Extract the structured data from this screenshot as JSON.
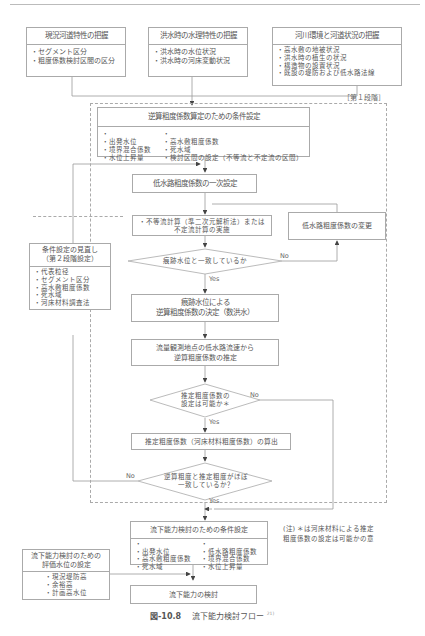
{
  "top_boxes": [
    {
      "title": "現況河道特性の把握",
      "items": [
        "セグメント区分",
        "粗度係数検討区間の区分"
      ]
    },
    {
      "title": "洪水時の水理特性の把握",
      "items": [
        "洪水時の水位状況",
        "洪水時の河床変動状況"
      ]
    },
    {
      "title": "河川環境と河道状況の把握",
      "items": [
        "高水敷の地被状況",
        "洪水時の植生の状況",
        "構造物の設置状況",
        "既設の堤防および低水路法線"
      ]
    }
  ],
  "stage1_label": "［第１段階］",
  "cond_reverse": {
    "title": "逆算粗度係数算定のための条件設定",
    "col1": [
      "出発水位",
      "境界混合係数",
      "水位上昇量"
    ],
    "col2": [
      "高水敷粗度係数",
      "死水域",
      "検討区間の設定（不等流と不定流の区間）"
    ]
  },
  "low_channel_initial": "低水路粗度係数の一次設定",
  "calc_box": {
    "line1": "・不等流計算（準二次元解析法）または",
    "line2": "不定流計算の実施"
  },
  "low_channel_change": "低水路粗度係数の変更",
  "decision1": {
    "text": "痕跡水位と一致しているか",
    "no": "No",
    "yes": "Yes"
  },
  "determine_box": {
    "line1": "痕跡水位による",
    "line2": "逆算粗度係数の決定（数洪水）"
  },
  "estimate_box": {
    "line1": "流量観測地点の低水路流速から",
    "line2": "逆算粗度係数の推定"
  },
  "decision2": {
    "line1": "推定粗度係数の",
    "line2": "設定は可能か＊",
    "no": "No",
    "yes": "Yes"
  },
  "calc_estimated": "推定粗度係数（河床材料粗度係数）の算出",
  "decision3": {
    "line1": "逆算粗度と推定粗度がほぼ",
    "line2": "一致しているか？",
    "no": "No",
    "yes": "Yes"
  },
  "review_box": {
    "title_line1": "条件設定の見直し",
    "title_line2": "（第２段階設定）",
    "items": [
      "代表粒径",
      "セグメント区分",
      "高水敷粗度係数",
      "死水域",
      "河床材料調査法"
    ]
  },
  "flow_cond": {
    "title": "流下能力検討のための条件設定",
    "col1": [
      "出発水位",
      "高水敷粗度係数",
      "死水域"
    ],
    "col2": [
      "低水路粗度係数",
      "境界混合係数",
      "水位上昇量"
    ]
  },
  "note": {
    "line1": "(注) ＊は河床材料による推定",
    "line2": "粗度係数の設定は可能かの意"
  },
  "eval_box": {
    "title_line1": "流下能力検討のための",
    "title_line2": "評価水位の設定",
    "items": [
      "現況堤防高",
      "余裕高",
      "計画高水位"
    ]
  },
  "final_box": "流下能力の検討",
  "caption": {
    "number": "図-10.8",
    "text": "流下能力検討フロー",
    "ref": "21)"
  }
}
